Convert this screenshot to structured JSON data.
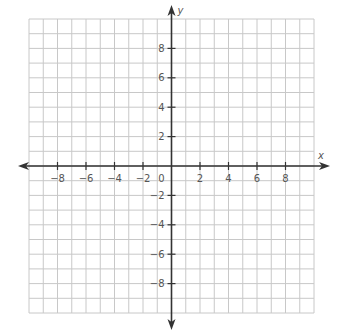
{
  "chart_data": {
    "type": "scatter",
    "title": "",
    "subtitle": "",
    "xlabel": "x",
    "ylabel": "y",
    "xlim": [
      -10,
      10
    ],
    "ylim": [
      -10,
      10
    ],
    "grid": true,
    "grid_step": 1,
    "origin_label": "0",
    "x_ticks": [
      -8,
      -6,
      -4,
      -2,
      2,
      4,
      6,
      8
    ],
    "x_tick_labels": [
      "−8",
      "−6",
      "−4",
      "−2",
      "2",
      "4",
      "6",
      "8"
    ],
    "y_ticks": [
      8,
      6,
      4,
      2,
      -2,
      -4,
      -6,
      -8
    ],
    "y_tick_labels": [
      "8",
      "6",
      "4",
      "2",
      "−2",
      "−4",
      "−6",
      "−8"
    ],
    "series": [],
    "legend": null,
    "annotations": []
  },
  "layout": {
    "grid_left": 29,
    "grid_top": 19,
    "grid_right": 314,
    "grid_bottom": 313,
    "x_axis_left": 18,
    "x_axis_right": 330,
    "y_axis_top": 5,
    "y_axis_bottom": 330,
    "colors": {
      "grid": "#c8c8c8",
      "axis": "#333333",
      "label": "#555555",
      "background": "#ffffff"
    }
  }
}
